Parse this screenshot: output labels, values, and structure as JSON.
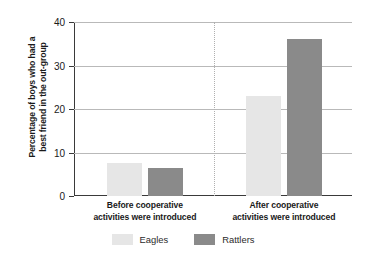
{
  "chart_data": {
    "type": "bar",
    "title": "",
    "xlabel": "",
    "ylabel": "Percentage of boys who had a best friend in the out-group",
    "ylabel_lines": [
      "Percentage of boys who had a",
      "best friend in the out-group"
    ],
    "ylim": [
      0,
      40
    ],
    "yticks": [
      0,
      10,
      20,
      30,
      40
    ],
    "ytick_labels": [
      "0",
      "10",
      "20",
      "30",
      "40"
    ],
    "grid": "horizontal",
    "legend_position": "bottom-center",
    "categories": [
      "Before cooperative activities were introduced",
      "After cooperative activities were introduced"
    ],
    "category_lines": [
      [
        "Before cooperative",
        "activities were introduced"
      ],
      [
        "After cooperative",
        "activities were introduced"
      ]
    ],
    "series": [
      {
        "name": "Eagles",
        "color": "#e6e6e6",
        "values": [
          7.5,
          23
        ]
      },
      {
        "name": "Rattlers",
        "color": "#8a8a8a",
        "values": [
          6.5,
          36
        ]
      }
    ]
  },
  "legend": {
    "items": [
      {
        "label": "Eagles",
        "color": "#e6e6e6"
      },
      {
        "label": "Rattlers",
        "color": "#8a8a8a"
      }
    ]
  }
}
